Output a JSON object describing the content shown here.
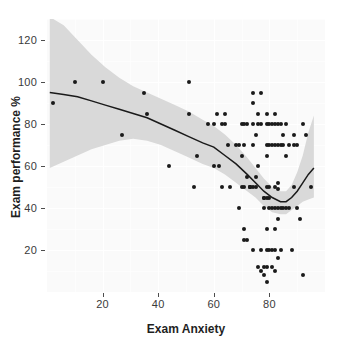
{
  "chart_data": {
    "type": "scatter",
    "title": "",
    "xlabel": "Exam Anxiety",
    "ylabel": "Exam performance %",
    "xlim": [
      0,
      100
    ],
    "ylim": [
      0,
      130
    ],
    "xticks": [
      20,
      40,
      60,
      80
    ],
    "yticks": [
      20,
      40,
      60,
      80,
      100,
      120
    ],
    "grid": true,
    "legend": "none",
    "series": [
      {
        "name": "observations",
        "type": "scatter",
        "marker": "filled-circle",
        "color": "#1a1a1a",
        "points": [
          [
            2,
            90
          ],
          [
            10,
            100
          ],
          [
            20,
            100
          ],
          [
            27,
            75
          ],
          [
            35,
            95
          ],
          [
            36,
            85
          ],
          [
            44,
            60
          ],
          [
            51,
            100
          ],
          [
            51,
            85
          ],
          [
            53,
            50
          ],
          [
            54,
            65
          ],
          [
            58,
            80
          ],
          [
            60,
            80
          ],
          [
            60,
            60
          ],
          [
            61,
            85
          ],
          [
            62,
            60
          ],
          [
            63,
            80
          ],
          [
            63,
            50
          ],
          [
            64,
            85
          ],
          [
            64,
            80
          ],
          [
            65,
            70
          ],
          [
            66,
            50
          ],
          [
            68,
            70
          ],
          [
            69,
            70
          ],
          [
            69,
            40
          ],
          [
            70,
            80
          ],
          [
            70,
            50
          ],
          [
            70,
            65
          ],
          [
            71,
            80
          ],
          [
            71,
            70
          ],
          [
            71,
            50
          ],
          [
            71,
            30
          ],
          [
            71,
            25
          ],
          [
            72,
            25
          ],
          [
            72,
            55
          ],
          [
            72,
            80
          ],
          [
            73,
            50
          ],
          [
            73,
            50
          ],
          [
            73,
            50
          ],
          [
            74,
            50
          ],
          [
            74,
            95
          ],
          [
            74,
            90
          ],
          [
            74,
            80
          ],
          [
            74,
            70
          ],
          [
            74,
            20
          ],
          [
            75,
            75
          ],
          [
            75,
            55
          ],
          [
            75,
            50
          ],
          [
            76,
            80
          ],
          [
            76,
            85
          ],
          [
            76,
            60
          ],
          [
            76,
            12
          ],
          [
            77,
            95
          ],
          [
            77,
            80
          ],
          [
            77,
            20
          ],
          [
            77,
            10
          ],
          [
            78,
            45
          ],
          [
            78,
            45
          ],
          [
            78,
            40
          ],
          [
            78,
            12
          ],
          [
            78,
            8
          ],
          [
            79,
            85
          ],
          [
            79,
            80
          ],
          [
            79,
            70
          ],
          [
            79,
            65
          ],
          [
            79,
            50
          ],
          [
            79,
            45
          ],
          [
            79,
            30
          ],
          [
            79,
            20
          ],
          [
            79,
            12
          ],
          [
            79,
            5
          ],
          [
            80,
            80
          ],
          [
            80,
            70
          ],
          [
            80,
            50
          ],
          [
            80,
            45
          ],
          [
            80,
            40
          ],
          [
            80,
            20
          ],
          [
            81,
            80
          ],
          [
            81,
            70
          ],
          [
            81,
            40
          ],
          [
            81,
            20
          ],
          [
            81,
            12
          ],
          [
            82,
            85
          ],
          [
            82,
            80
          ],
          [
            82,
            70
          ],
          [
            82,
            50
          ],
          [
            82,
            40
          ],
          [
            82,
            30
          ],
          [
            82,
            20
          ],
          [
            82,
            10
          ],
          [
            83,
            80
          ],
          [
            83,
            70
          ],
          [
            83,
            52
          ],
          [
            83,
            49
          ],
          [
            83,
            40
          ],
          [
            83,
            35
          ],
          [
            83,
            16
          ],
          [
            84,
            80
          ],
          [
            84,
            70
          ],
          [
            84,
            40
          ],
          [
            84,
            20
          ],
          [
            85,
            75
          ],
          [
            85,
            70
          ],
          [
            85,
            40
          ],
          [
            86,
            80
          ],
          [
            86,
            65
          ],
          [
            86,
            40
          ],
          [
            87,
            70
          ],
          [
            87,
            40
          ],
          [
            88,
            20
          ],
          [
            89,
            75
          ],
          [
            89,
            70
          ],
          [
            89,
            50
          ],
          [
            90,
            70
          ],
          [
            90,
            40
          ],
          [
            91,
            35
          ],
          [
            92,
            80
          ],
          [
            92,
            8
          ],
          [
            93,
            75
          ],
          [
            95,
            50
          ]
        ]
      },
      {
        "name": "loess-fit",
        "type": "line",
        "color": "#1a1a1a",
        "points": [
          [
            1,
            95
          ],
          [
            6,
            94
          ],
          [
            11,
            93
          ],
          [
            16,
            91
          ],
          [
            21,
            89
          ],
          [
            26,
            87
          ],
          [
            31,
            85
          ],
          [
            36,
            83
          ],
          [
            41,
            80
          ],
          [
            46,
            77
          ],
          [
            51,
            74
          ],
          [
            56,
            71
          ],
          [
            60,
            69
          ],
          [
            64,
            65
          ],
          [
            68,
            61
          ],
          [
            72,
            56
          ],
          [
            75,
            52
          ],
          [
            78,
            48
          ],
          [
            81,
            45
          ],
          [
            84,
            43
          ],
          [
            86,
            43
          ],
          [
            88,
            45
          ],
          [
            90,
            48
          ],
          [
            92,
            52
          ],
          [
            94,
            56
          ],
          [
            96,
            59
          ]
        ]
      },
      {
        "name": "confidence-band",
        "type": "ribbon",
        "color": "#d9d9d9",
        "upper": [
          [
            1,
            131
          ],
          [
            6,
            127
          ],
          [
            11,
            120
          ],
          [
            16,
            113
          ],
          [
            21,
            107
          ],
          [
            26,
            102
          ],
          [
            31,
            98
          ],
          [
            36,
            95
          ],
          [
            41,
            92
          ],
          [
            46,
            89
          ],
          [
            51,
            86
          ],
          [
            56,
            82
          ],
          [
            60,
            79
          ],
          [
            64,
            75
          ],
          [
            68,
            70
          ],
          [
            72,
            64
          ],
          [
            75,
            59
          ],
          [
            78,
            54
          ],
          [
            81,
            50
          ],
          [
            84,
            48
          ],
          [
            86,
            48
          ],
          [
            88,
            51
          ],
          [
            90,
            57
          ],
          [
            92,
            65
          ],
          [
            94,
            76
          ],
          [
            96,
            84
          ]
        ],
        "lower": [
          [
            1,
            59
          ],
          [
            6,
            62
          ],
          [
            11,
            65
          ],
          [
            16,
            68
          ],
          [
            21,
            70
          ],
          [
            26,
            72
          ],
          [
            31,
            73
          ],
          [
            36,
            72
          ],
          [
            41,
            70
          ],
          [
            46,
            67
          ],
          [
            51,
            64
          ],
          [
            56,
            61
          ],
          [
            60,
            59
          ],
          [
            64,
            56
          ],
          [
            68,
            52
          ],
          [
            72,
            48
          ],
          [
            75,
            45
          ],
          [
            78,
            41
          ],
          [
            81,
            38
          ],
          [
            84,
            37
          ],
          [
            86,
            37
          ],
          [
            88,
            39
          ],
          [
            90,
            41
          ],
          [
            92,
            43
          ],
          [
            94,
            44
          ],
          [
            96,
            45
          ]
        ]
      }
    ]
  },
  "axes": {
    "x_tick_labels": [
      "20",
      "40",
      "60",
      "80"
    ],
    "y_tick_labels": [
      "20",
      "40",
      "60",
      "80",
      "100",
      "120"
    ],
    "x_title": "Exam Anxiety",
    "y_title": "Exam performance %"
  },
  "colors": {
    "panel_background": "#fafafa",
    "grid": "#ffffff",
    "point": "#1a1a1a",
    "line": "#1a1a1a",
    "ribbon": "#d9d9d9",
    "text": "#1f1f1f"
  }
}
